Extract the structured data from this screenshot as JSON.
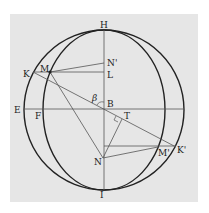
{
  "diagram": {
    "labels": {
      "H": "H",
      "K": "K",
      "M": "M",
      "N_prime": "N'",
      "L": "L",
      "beta": "β",
      "B": "B",
      "E": "E",
      "F": "F",
      "T": "T",
      "N": "N",
      "M_prime": "M'",
      "K_prime": "K'",
      "I": "I"
    },
    "colors": {
      "panel": "#e6e6e6",
      "stroke": "#222222",
      "thin": "#555555"
    }
  }
}
